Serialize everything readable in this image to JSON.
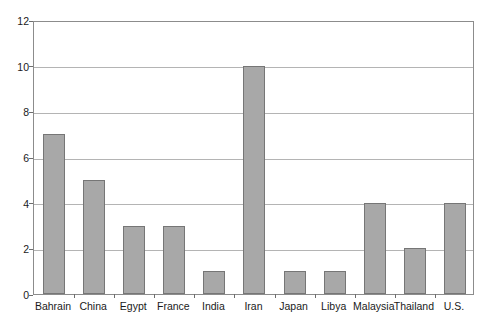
{
  "chart_data": {
    "type": "bar",
    "title": "",
    "subtitle": "",
    "xlabel": "",
    "ylabel": "",
    "ylim": [
      0,
      12
    ],
    "ytick_step": 2,
    "yticks": [
      0,
      2,
      4,
      6,
      8,
      10,
      12
    ],
    "grid": true,
    "legend": false,
    "legend_position": "none",
    "categories": [
      "Bahrain",
      "China",
      "Egypt",
      "France",
      "India",
      "Iran",
      "Japan",
      "Libya",
      "Malaysia",
      "Thailand",
      "U.S."
    ],
    "values": [
      7,
      5,
      3,
      3,
      1,
      10,
      1,
      1,
      4,
      2,
      4
    ],
    "series": [
      {
        "name": "",
        "values": [
          7,
          5,
          3,
          3,
          1,
          10,
          1,
          1,
          4,
          2,
          4
        ]
      }
    ]
  },
  "style": {
    "bar_fill": "#a8a8a8",
    "bar_border": "#767676",
    "gridline_color": "#b4b4b4",
    "axis_color": "#8c8c8c",
    "tick_color": "#6e6e6e",
    "text_color": "#1a1a1a",
    "background": "#ffffff"
  }
}
